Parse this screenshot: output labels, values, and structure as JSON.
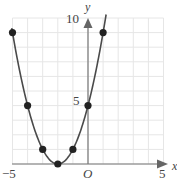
{
  "chart_data": {
    "type": "line",
    "title": "",
    "xlabel": "x",
    "ylabel": "y",
    "origin_label": "O",
    "xlim": [
      -5,
      5
    ],
    "ylim": [
      0,
      10
    ],
    "grid": true,
    "x_ticks": [
      "-5",
      "5"
    ],
    "y_ticks": [
      "5",
      "10"
    ],
    "series": [
      {
        "name": "y = (x + 2)^2",
        "x": [
          -5,
          -4,
          -3,
          -2,
          -1,
          0,
          1
        ],
        "values": [
          9,
          4,
          1,
          0,
          1,
          4,
          9
        ],
        "markers": true
      }
    ]
  },
  "labels": {
    "x_axis": "x",
    "y_axis": "y",
    "origin": "O",
    "x_min": "−5",
    "x_max": "5",
    "y_mid": "5",
    "y_max": "10"
  },
  "colors": {
    "curve": "#4a4a4a",
    "marker": "#222222",
    "axis": "#666666",
    "grid": "#e6e6e6"
  }
}
